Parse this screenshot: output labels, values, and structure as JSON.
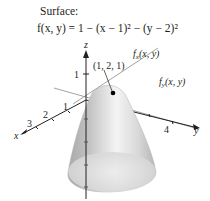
{
  "header": {
    "title": "Surface:",
    "formula": "f(x, y) = 1 − (x − 1)² − (y − 2)²"
  },
  "axes": {
    "x_label": "x",
    "y_label": "y",
    "z_label": "z",
    "x_ticks": [
      "1",
      "2",
      "3"
    ],
    "y_ticks": [
      "4"
    ],
    "z_ticks": [
      "1"
    ]
  },
  "annotations": {
    "point": "(1, 2, 1)",
    "tangent_x": "fx(x, y)",
    "tangent_x_main": "f",
    "tangent_x_sub": "x",
    "tangent_x_args": "(x, y)",
    "tangent_y_main": "f",
    "tangent_y_sub": "y",
    "tangent_y_args": "(x, y)"
  },
  "colors": {
    "surface_light": "#f2f2f2",
    "surface_mid": "#c8c8c8",
    "surface_dark": "#9a9a9a",
    "axis": "#231f20",
    "tangent": "#8a8a8a",
    "point": "#000000"
  }
}
